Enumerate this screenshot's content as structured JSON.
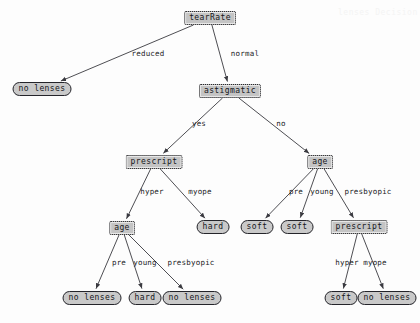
{
  "diagram": {
    "node_fill": "#c9c9c9",
    "node_stroke": "#24242a",
    "edge_color": "#3a3a40",
    "background": "#fdfdfd"
  },
  "nodes": {
    "root": {
      "label": "tearRate",
      "type": "decision",
      "x": 210,
      "y": 18
    },
    "no_lenses_reduced": {
      "label": "no lenses",
      "type": "leaf",
      "x": 42,
      "y": 89
    },
    "astigmatic": {
      "label": "astigmatic",
      "type": "decision",
      "x": 230,
      "y": 91
    },
    "prescript_left": {
      "label": "prescript",
      "type": "decision",
      "x": 154,
      "y": 162
    },
    "age_right": {
      "label": "age",
      "type": "decision",
      "x": 320,
      "y": 162
    },
    "hard_myope": {
      "label": "hard",
      "type": "leaf",
      "x": 213,
      "y": 227
    },
    "age_left": {
      "label": "age",
      "type": "decision",
      "x": 122,
      "y": 228
    },
    "soft_pre": {
      "label": "soft",
      "type": "leaf",
      "x": 257,
      "y": 227
    },
    "soft_young": {
      "label": "soft",
      "type": "leaf",
      "x": 297,
      "y": 227
    },
    "prescript_right": {
      "label": "prescript",
      "type": "decision",
      "x": 359,
      "y": 227
    },
    "no_lenses_pre": {
      "label": "no lenses",
      "type": "leaf",
      "x": 92,
      "y": 298
    },
    "hard_young": {
      "label": "hard",
      "type": "leaf",
      "x": 145,
      "y": 298
    },
    "no_lenses_presby": {
      "label": "no lenses",
      "type": "leaf",
      "x": 192,
      "y": 298
    },
    "soft_hyper": {
      "label": "soft",
      "type": "leaf",
      "x": 341,
      "y": 298
    },
    "no_lenses_myope": {
      "label": "no lenses",
      "type": "leaf",
      "x": 387,
      "y": 298
    }
  },
  "edges": [
    {
      "from": "root",
      "to": "no_lenses_reduced",
      "label": "reduced",
      "label_x": 148,
      "label_y": 54
    },
    {
      "from": "root",
      "to": "astigmatic",
      "label": "normal",
      "label_x": 245,
      "label_y": 54
    },
    {
      "from": "astigmatic",
      "to": "prescript_left",
      "label": "yes",
      "label_x": 199,
      "label_y": 124
    },
    {
      "from": "astigmatic",
      "to": "age_right",
      "label": "no",
      "label_x": 281,
      "label_y": 124
    },
    {
      "from": "prescript_left",
      "to": "age_left",
      "label": "hyper",
      "label_x": 152,
      "label_y": 192
    },
    {
      "from": "prescript_left",
      "to": "hard_myope",
      "label": "myope",
      "label_x": 200,
      "label_y": 192
    },
    {
      "from": "age_right",
      "to": "soft_pre",
      "label": "pre",
      "label_x": 296,
      "label_y": 192
    },
    {
      "from": "age_right",
      "to": "soft_young",
      "label": "young",
      "label_x": 322,
      "label_y": 192
    },
    {
      "from": "age_right",
      "to": "prescript_right",
      "label": "presbyopic",
      "label_x": 368,
      "label_y": 192
    },
    {
      "from": "age_left",
      "to": "no_lenses_pre",
      "label": "pre",
      "label_x": 119,
      "label_y": 263
    },
    {
      "from": "age_left",
      "to": "hard_young",
      "label": "young",
      "label_x": 145,
      "label_y": 263
    },
    {
      "from": "age_left",
      "to": "no_lenses_presby",
      "label": "presbyopic",
      "label_x": 191,
      "label_y": 263
    },
    {
      "from": "prescript_right",
      "to": "soft_hyper",
      "label": "hyper",
      "label_x": 347,
      "label_y": 263
    },
    {
      "from": "prescript_right",
      "to": "no_lenses_myope",
      "label": "myope",
      "label_x": 375,
      "label_y": 263
    }
  ],
  "watermarks": [
    {
      "text": "lenses Decision",
      "x": 338,
      "y": 8
    }
  ]
}
